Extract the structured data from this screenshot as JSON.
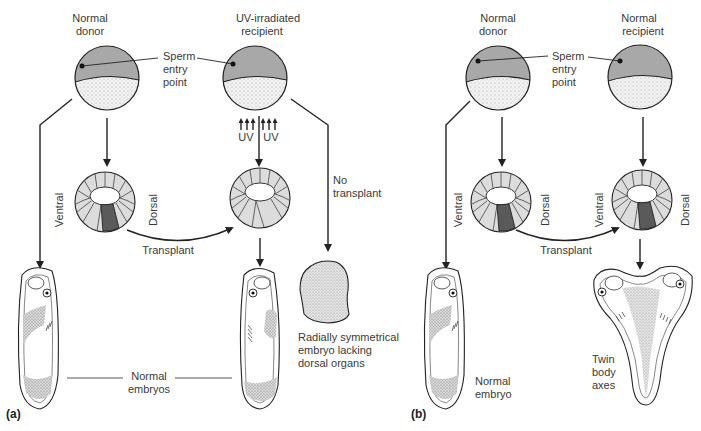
{
  "panel_a": {
    "label": "(a)",
    "donor_title": [
      "Normal",
      "donor"
    ],
    "recipient_title": [
      "UV-irradiated",
      "recipient"
    ],
    "sperm_label": [
      "Sperm",
      "entry",
      "point"
    ],
    "uv_labels": [
      "UV",
      "UV"
    ],
    "ventral": "Ventral",
    "dorsal": "Dorsal",
    "transplant": "Transplant",
    "no_transplant": [
      "No",
      "transplant"
    ],
    "radial_label": [
      "Radially symmetrical",
      "embryo lacking",
      "dorsal organs"
    ],
    "normal_embryos": [
      "Normal",
      "embryos"
    ]
  },
  "panel_b": {
    "label": "(b)",
    "donor_title": [
      "Normal",
      "donor"
    ],
    "recipient_title": [
      "Normal",
      "recipient"
    ],
    "sperm_label": [
      "Sperm",
      "entry",
      "point"
    ],
    "ventral_left": "Ventral",
    "dorsal_left": "Dorsal",
    "ventral_right": "Ventral",
    "dorsal_right": "Dorsal",
    "transplant": "Transplant",
    "normal_embryo": [
      "Normal",
      "embryo"
    ],
    "twin_label": [
      "Twin",
      "body",
      "axes"
    ]
  },
  "colors": {
    "animal_hemisphere": "#a9a9a9",
    "vegetal_hemisphere": "#ececec",
    "cell_light": "#dcdcdc",
    "cell_dark": "#5a5a5a",
    "line": "#222222"
  }
}
